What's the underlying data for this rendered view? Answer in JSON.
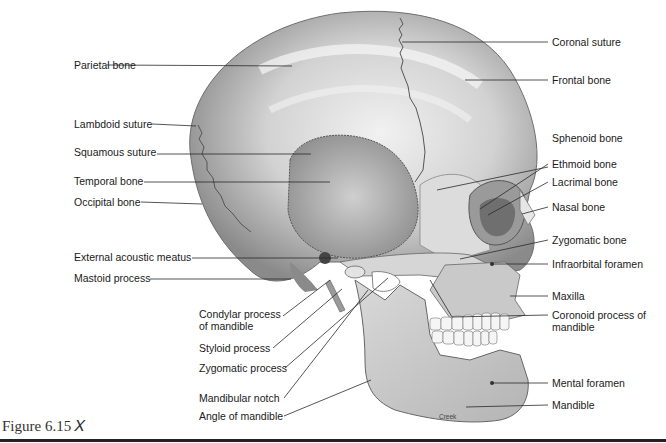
{
  "figure": {
    "label": "Figure 6.15",
    "icon": "figure-person-icon",
    "credit": "Creek"
  },
  "colors": {
    "bone_light": "#e6e6e6",
    "bone_mid": "#bdbdbd",
    "bone_dark": "#7a7a7a",
    "leader_line": "#2a2a2a",
    "text": "#1a1a1a",
    "rule": "#222222"
  },
  "labels_left": [
    {
      "id": "parietal",
      "text": "Parietal bone"
    },
    {
      "id": "lambdoid",
      "text": "Lambdoid suture"
    },
    {
      "id": "squamous",
      "text": "Squamous suture"
    },
    {
      "id": "temporal",
      "text": "Temporal bone"
    },
    {
      "id": "occipital",
      "text": "Occipital bone"
    },
    {
      "id": "ext-acoustic",
      "text": "External acoustic meatus"
    },
    {
      "id": "mastoid",
      "text": "Mastoid process"
    },
    {
      "id": "condylar",
      "text": "Condylar process of mandible"
    },
    {
      "id": "styloid",
      "text": "Styloid process"
    },
    {
      "id": "zygomatic-process",
      "text": "Zygomatic process"
    },
    {
      "id": "mandibular-notch",
      "text": "Mandibular notch"
    },
    {
      "id": "angle-mandible",
      "text": "Angle of mandible"
    }
  ],
  "labels_right": [
    {
      "id": "coronal",
      "text": "Coronal suture"
    },
    {
      "id": "frontal",
      "text": "Frontal bone"
    },
    {
      "id": "sphenoid",
      "text": "Sphenoid bone"
    },
    {
      "id": "ethmoid",
      "text": "Ethmoid bone"
    },
    {
      "id": "lacrimal",
      "text": "Lacrimal bone"
    },
    {
      "id": "nasal",
      "text": "Nasal bone"
    },
    {
      "id": "zygomatic-bone",
      "text": "Zygomatic bone"
    },
    {
      "id": "infraorbital",
      "text": "Infraorbital foramen"
    },
    {
      "id": "maxilla",
      "text": "Maxilla"
    },
    {
      "id": "coronoid",
      "text": "Coronoid process of mandible"
    },
    {
      "id": "mental-foramen",
      "text": "Mental foramen"
    },
    {
      "id": "mandible",
      "text": "Mandible"
    }
  ]
}
